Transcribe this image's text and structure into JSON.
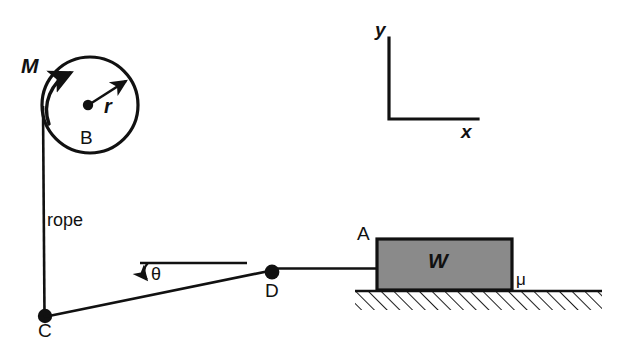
{
  "figure": {
    "background_color": "#ffffff",
    "line_color": "#111111",
    "block_fill_color": "#8a8a8a"
  },
  "labels": {
    "flywheel_mass": "M",
    "radius": "r",
    "flywheel_body": "B",
    "rope": "rope",
    "point_c": "C",
    "angle_theta": "θ",
    "point_d": "D",
    "point_a": "A",
    "block_weight": "W",
    "friction_coefficient": "μ",
    "axis_y": "y",
    "axis_x": "x"
  },
  "geometry": {
    "pulley": {
      "center_x": 90,
      "center_y": 105,
      "outer_radius": 48,
      "hub_radius": 5
    },
    "rope_vertical": {
      "x": 43,
      "y_top": 108,
      "y_bottom": 316
    },
    "point_c": {
      "x": 45,
      "y": 316,
      "dot_radius": 7
    },
    "point_d": {
      "x": 272,
      "y": 272,
      "dot_radius": 7
    },
    "incline": {
      "x1": 45,
      "y1": 316,
      "x2": 272,
      "y2": 270
    },
    "horizontal_reference": {
      "x1": 140,
      "x2": 247,
      "y": 263
    },
    "rope_to_block": {
      "x1": 272,
      "x2": 377,
      "y": 268
    },
    "block": {
      "x": 377,
      "y": 239,
      "width": 135,
      "height": 51
    },
    "ground": {
      "x1": 355,
      "x2": 602,
      "y": 291,
      "hatch_depth": 19
    },
    "axes": {
      "origin_x": 389,
      "origin_y": 119,
      "y_top": 38,
      "x_right": 478
    }
  }
}
